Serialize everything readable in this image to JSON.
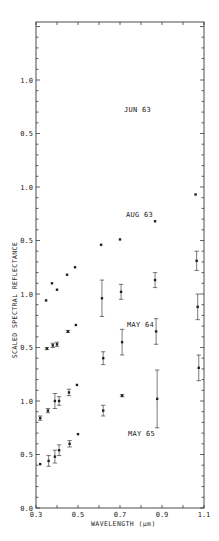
{
  "chart_data": {
    "type": "scatter",
    "title": "",
    "xlabel": "WAVELENGTH (μm)",
    "ylabel": "SCALED SPECTRAL REFLECTANCE",
    "xlim": [
      0.3,
      1.1
    ],
    "x_ticks": [
      0.3,
      0.5,
      0.7,
      0.9,
      1.1
    ],
    "x_tick_labels": [
      "0.3",
      "0.5",
      "0.7",
      "0.9",
      "1.1"
    ],
    "y_tick_labels_top_to_bottom": [
      "1.0",
      "0.5",
      "1.0",
      "0.5",
      "1.0",
      "0.5",
      "1.0",
      "0.5",
      "0.0"
    ],
    "panel_offset": 0.5,
    "grid": false,
    "legend": "none (panel labels inside plot)",
    "series": [
      {
        "name": "JUN 63",
        "offset_index": 3,
        "x": [
          0.348,
          0.376,
          0.4,
          0.448,
          0.486,
          0.61,
          0.7,
          0.867,
          1.06
        ],
        "values": [
          0.44,
          0.6,
          0.54,
          0.68,
          0.75,
          0.96,
          1.01,
          1.18,
          1.43
        ],
        "errors": [
          0,
          0,
          0,
          0,
          0,
          0,
          0,
          0,
          0
        ]
      },
      {
        "name": "AUG 63",
        "offset_index": 2,
        "x": [
          0.352,
          0.38,
          0.4,
          0.452,
          0.49,
          0.614,
          0.705,
          0.867,
          1.065
        ],
        "values": [
          0.49,
          0.52,
          0.53,
          0.65,
          0.71,
          0.96,
          1.02,
          1.13,
          1.31
        ],
        "errors": [
          0.01,
          0.02,
          0.02,
          0.01,
          0,
          0.17,
          0.07,
          0.07,
          0.09
        ]
      },
      {
        "name": "MAY 64",
        "offset_index": 1,
        "x": [
          0.32,
          0.357,
          0.39,
          0.41,
          0.457,
          0.495,
          0.62,
          0.71,
          0.872,
          1.07
        ],
        "values": [
          0.34,
          0.41,
          0.5,
          0.5,
          0.58,
          0.65,
          0.9,
          1.05,
          1.15,
          1.38
        ],
        "errors": [
          0.02,
          0.02,
          0.07,
          0.04,
          0.03,
          0,
          0.06,
          0.12,
          0.12,
          0.12
        ]
      },
      {
        "name": "MAY 65",
        "offset_index": 0,
        "x": [
          0.32,
          0.36,
          0.39,
          0.41,
          0.46,
          0.5,
          0.62,
          0.71,
          0.877,
          1.075
        ],
        "values": [
          0.41,
          0.44,
          0.48,
          0.54,
          0.6,
          0.69,
          0.91,
          1.05,
          1.02,
          1.31
        ],
        "errors": [
          0,
          0.05,
          0.06,
          0.05,
          0.03,
          0,
          0.05,
          0.01,
          0.27,
          0.12
        ]
      }
    ]
  },
  "labels": {
    "panel_jun63": "JUN 63",
    "panel_aug63": "AUG 63",
    "panel_may64": "MAY 64",
    "panel_may65": "MAY 65",
    "xlabel": "WAVELENGTH (μm)",
    "ylabel": "SCALED SPECTRAL REFLECTANCE"
  },
  "colors": {
    "ink": "#222222",
    "background": "#ffffff"
  }
}
